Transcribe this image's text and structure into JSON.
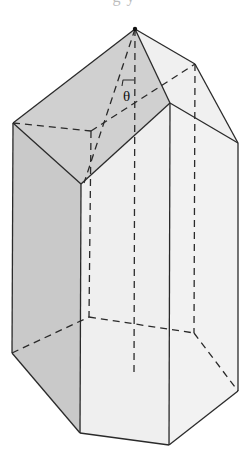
{
  "figure": {
    "cropped_top_text": "g y",
    "angle_label": "θ",
    "colors": {
      "background": "#ffffff",
      "dark_face": "#c9c9c9",
      "pyramid_dark_face": "#d0d0d0",
      "light_face": "#efefef",
      "edge": "#2a2a2a"
    },
    "vertices": {
      "apex": [
        135,
        29
      ],
      "top_left": [
        13,
        123
      ],
      "front_left_top": [
        81,
        184
      ],
      "front_right_top": [
        170,
        103
      ],
      "right_top": [
        238,
        143
      ],
      "back_right_top": [
        195,
        64
      ],
      "back_left_top": [
        91,
        131
      ],
      "bottom_left": [
        12,
        353
      ],
      "front_left_bottom": [
        80,
        433
      ],
      "front_right_bottom": [
        169,
        445
      ],
      "right_bottom": [
        238,
        391
      ],
      "back_right_bottom": [
        194,
        333
      ],
      "back_left_bottom": [
        89,
        317
      ],
      "axis_bottom": [
        134,
        376
      ]
    }
  }
}
